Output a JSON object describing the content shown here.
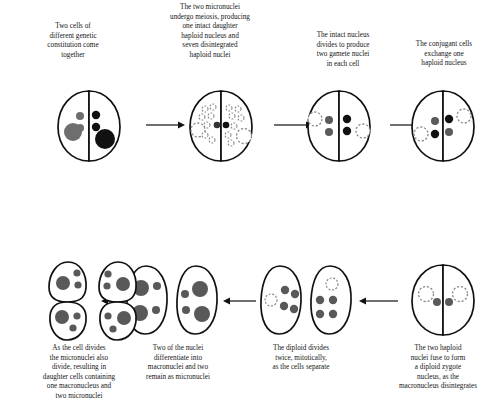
{
  "figure": {
    "type": "biological-process-diagram",
    "background_color": "#ffffff",
    "outline_color": "#111111",
    "grey_nucleus_color": "#6e6e6e",
    "dark_grey_nucleus_color": "#595959",
    "black_nucleus_color": "#111111",
    "dashed_nucleus_color": "#8a8a8a",
    "arrow_color": "#111111"
  },
  "top_row": {
    "flow_direction": "left-to-right",
    "stages": [
      {
        "id": "stage-1",
        "caption": "Two cells of\ndifferent genetic\nconstitution come\ntogether",
        "cell_type": "conjugating-pair",
        "left_half": {
          "macronucleus": "grey-filled",
          "micronuclei": 2,
          "micronuclei_style": "grey-filled"
        },
        "right_half": {
          "macronucleus": "black-filled",
          "micronuclei": 2,
          "micronuclei_style": "black-filled"
        }
      },
      {
        "id": "stage-2",
        "caption": "The two micronuclei\nundergo meiosis, producing\none intact daughter\nhaploid nucleus and\nseven disintegrated\nhaploid nuclei",
        "cell_type": "conjugating-pair",
        "left_half": {
          "macronucleus": "dashed-outline",
          "intact_haploid_nuclei": 1,
          "disintegrated_nuclei": 7
        },
        "right_half": {
          "macronucleus": "dashed-outline",
          "intact_haploid_nuclei": 1,
          "disintegrated_nuclei": 7
        }
      },
      {
        "id": "stage-3",
        "caption": "The intact nucleus\ndivides to produce\ntwo gamete nuclei\nin each cell",
        "cell_type": "conjugating-pair",
        "left_half": {
          "macronucleus": "dashed-outline",
          "gamete_nuclei": 2,
          "gamete_style": "grey-filled"
        },
        "right_half": {
          "macronucleus": "dashed-outline",
          "gamete_nuclei": 2,
          "gamete_style": "black-filled"
        }
      },
      {
        "id": "stage-4",
        "caption": "The conjugant cells\nexchange one\nhaploid nucleus",
        "cell_type": "conjugating-pair",
        "left_half": {
          "macronucleus": "dashed-outline",
          "nuclei": [
            "grey-filled",
            "black-filled"
          ]
        },
        "right_half": {
          "macronucleus": "dashed-outline",
          "nuclei": [
            "black-filled",
            "grey-filled"
          ]
        }
      }
    ]
  },
  "bottom_row": {
    "flow_direction": "right-to-left",
    "stages": [
      {
        "id": "stage-5",
        "caption": "The two haploid\nnuclei fuse to form\na diploid zygote\nnucleus, as the\nmacronucleus disintegrates",
        "cell_type": "conjugating-pair",
        "left_half": {
          "macronucleus": "dashed-outline",
          "zygote_nucleus": 1,
          "zygote_style": "dark-grey-filled"
        },
        "right_half": {
          "macronucleus": "dashed-outline",
          "zygote_nucleus": 1,
          "zygote_style": "dark-grey-filled"
        }
      },
      {
        "id": "stage-6",
        "caption": "The diploid divides\ntwice, mitotically,\nas the cells separate",
        "cell_type": "separated-single-cells",
        "cells": [
          {
            "nuclei": 4,
            "nuclei_style": "dark-grey-filled",
            "macronucleus_remnant": "dashed-outline"
          },
          {
            "nuclei": 4,
            "nuclei_style": "dark-grey-filled",
            "macronucleus_remnant": "dashed-outline"
          }
        ]
      },
      {
        "id": "stage-7",
        "caption": "Two of the nuclei\ndifferentiate into\nmacronuclei and two\nremain as micronuclei",
        "cell_type": "single-cells",
        "cells": [
          {
            "macronuclei": 2,
            "micronuclei": 2,
            "style": "dark-grey-filled"
          },
          {
            "macronuclei": 2,
            "micronuclei": 2,
            "style": "dark-grey-filled"
          }
        ]
      },
      {
        "id": "stage-8",
        "caption": "As the cell divides\nthe micronuclei also\ndivide, resulting in\ndaughter cells containing\none macronucleus and\ntwo micronuclei",
        "cell_type": "dividing-cells",
        "cells": [
          {
            "daughter_compartments": 2,
            "per_compartment": {
              "macronuclei": 1,
              "micronuclei": 2
            }
          },
          {
            "daughter_compartments": 2,
            "per_compartment": {
              "macronuclei": 1,
              "micronuclei": 2
            }
          }
        ]
      }
    ]
  },
  "arrows": {
    "top": [
      {
        "id": "arrow-1-2",
        "direction": "right"
      },
      {
        "id": "arrow-2-3",
        "direction": "right"
      },
      {
        "id": "arrow-3-4",
        "direction": "right"
      }
    ],
    "connector": {
      "id": "arrow-4-5",
      "direction": "down"
    },
    "bottom": [
      {
        "id": "arrow-5-6",
        "direction": "left"
      },
      {
        "id": "arrow-6-7",
        "direction": "left"
      },
      {
        "id": "arrow-7-8",
        "direction": "left"
      }
    ]
  }
}
